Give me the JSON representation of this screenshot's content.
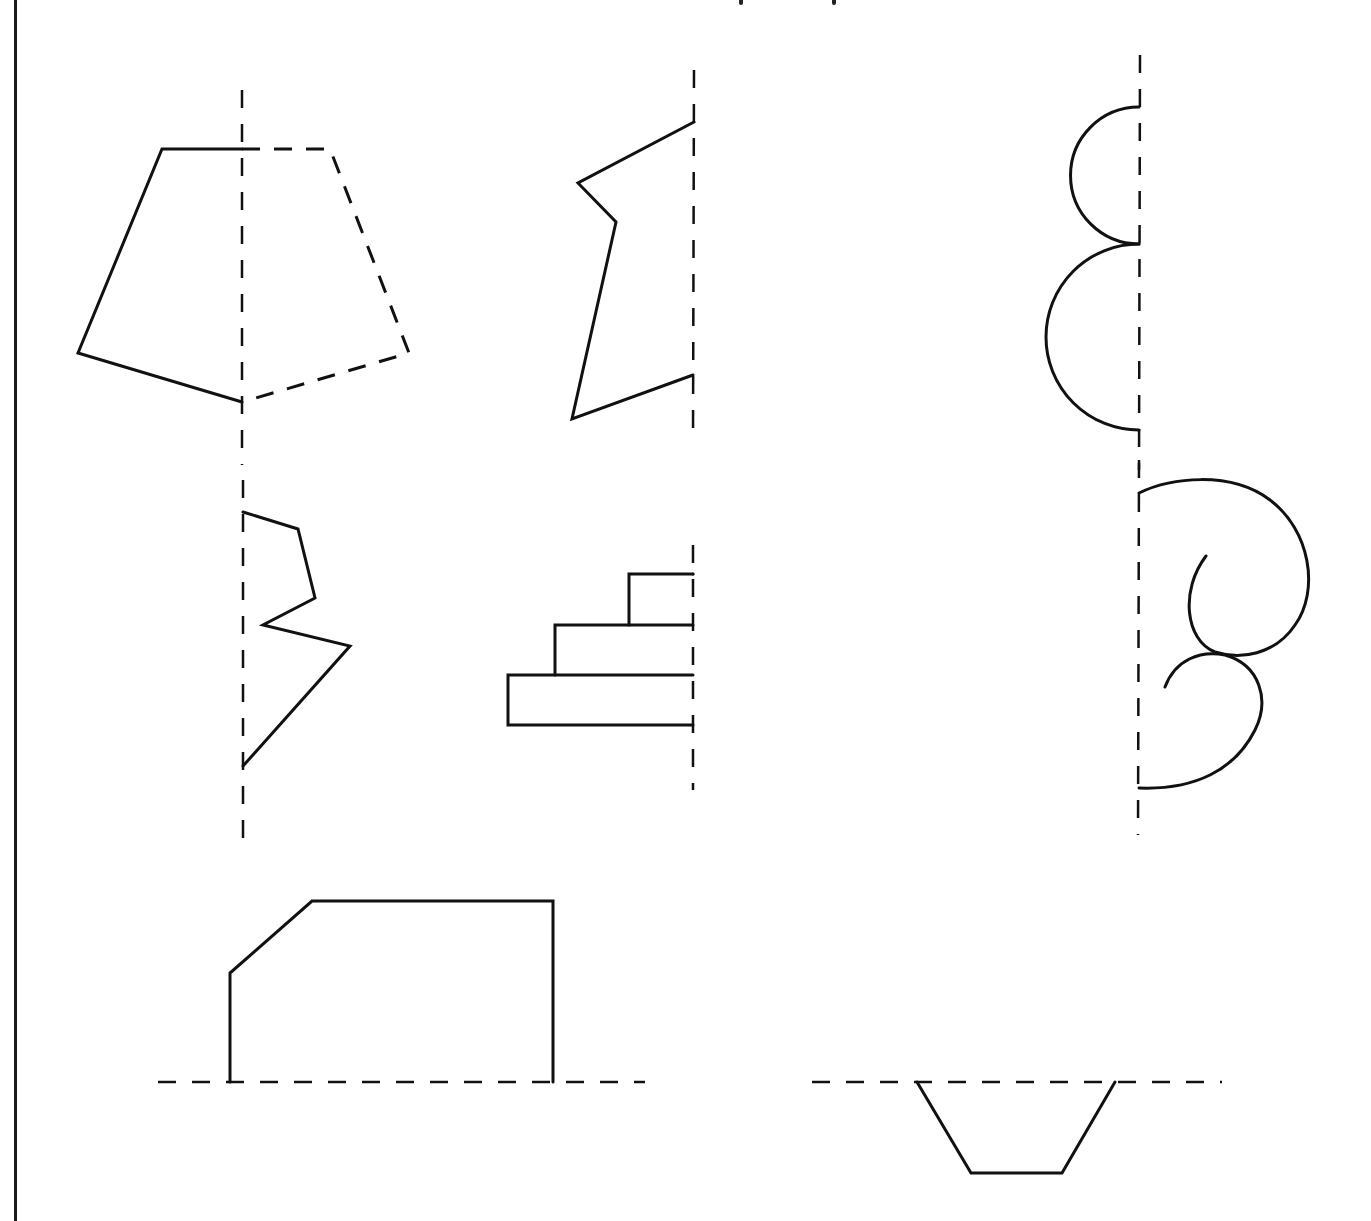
{
  "worksheet": {
    "topic": "Lines of symmetry - complete the mirror image",
    "stroke_color": "#111111",
    "background_color": "#ffffff",
    "figures": [
      {
        "id": "fig-1",
        "description": "Pentagon half with completed dashed reflection",
        "axis": "vertical",
        "axis_x": 242
      },
      {
        "id": "fig-2",
        "description": "Zigzag polygon half",
        "axis": "vertical",
        "axis_x": 693
      },
      {
        "id": "fig-3",
        "description": "Two semicircles stacked",
        "axis": "vertical",
        "axis_x": 1139
      },
      {
        "id": "fig-4",
        "description": "Lightning-bolt half",
        "axis": "vertical",
        "axis_x": 243
      },
      {
        "id": "fig-5",
        "description": "Stepped rectangles half",
        "axis": "vertical",
        "axis_x": 693
      },
      {
        "id": "fig-6",
        "description": "Spiral scroll curves half",
        "axis": "vertical",
        "axis_x": 1139
      },
      {
        "id": "fig-7",
        "description": "House-shaped polygon half above axis",
        "axis": "horizontal",
        "axis_y": 1082
      },
      {
        "id": "fig-8",
        "description": "Trapezoid half below axis",
        "axis": "horizontal",
        "axis_y": 1082
      }
    ]
  }
}
